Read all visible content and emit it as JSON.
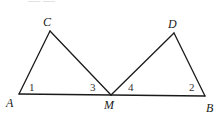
{
  "diagram": {
    "type": "geometry",
    "stroke_color": "#1a1a1a",
    "vertices": [
      {
        "id": "A",
        "label": "A",
        "x": 19,
        "y": 94,
        "label_x": 6,
        "label_y": 107
      },
      {
        "id": "C",
        "label": "C",
        "x": 50,
        "y": 31,
        "label_x": 43,
        "label_y": 26
      },
      {
        "id": "M",
        "label": "M",
        "x": 111,
        "y": 95,
        "label_x": 104,
        "label_y": 109
      },
      {
        "id": "D",
        "label": "D",
        "x": 174,
        "y": 33,
        "label_x": 168,
        "label_y": 28
      },
      {
        "id": "B",
        "label": "B",
        "x": 205,
        "y": 96,
        "label_x": 206,
        "label_y": 112
      }
    ],
    "segments": [
      {
        "from": "A",
        "to": "B"
      },
      {
        "from": "A",
        "to": "C"
      },
      {
        "from": "C",
        "to": "M"
      },
      {
        "from": "M",
        "to": "D"
      },
      {
        "from": "D",
        "to": "B"
      }
    ],
    "angle_labels": [
      {
        "label": "1",
        "vertex": "A",
        "x": 29,
        "y": 91
      },
      {
        "label": "3",
        "vertex": "M",
        "x": 90,
        "y": 91
      },
      {
        "label": "4",
        "vertex": "M",
        "x": 128,
        "y": 91
      },
      {
        "label": "2",
        "vertex": "B",
        "x": 189,
        "y": 91
      }
    ],
    "cut_off_text": "—  —"
  }
}
